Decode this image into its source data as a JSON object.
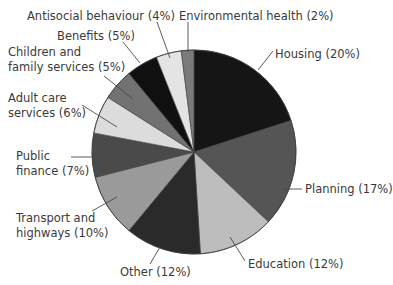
{
  "chart_data": {
    "type": "pie",
    "title": "",
    "start_angle_deg": 0,
    "direction": "clockwise",
    "center": [
      194,
      152
    ],
    "radius": 102,
    "slices": [
      {
        "label": "Housing",
        "value": 20,
        "text": "Housing (20%)",
        "color": "#151515"
      },
      {
        "label": "Planning",
        "value": 17,
        "text": "Planning (17%)",
        "color": "#555555"
      },
      {
        "label": "Education",
        "value": 12,
        "text": "Education (12%)",
        "color": "#bdbdbd"
      },
      {
        "label": "Other",
        "value": 12,
        "text": "Other (12%)",
        "color": "#2a2a2a"
      },
      {
        "label": "Transport and highways",
        "value": 10,
        "text": "Transport and\nhighways (10%)",
        "color": "#9a9a9a"
      },
      {
        "label": "Public finance",
        "value": 7,
        "text": "Public\nfinance (7%)",
        "color": "#4a4a4a"
      },
      {
        "label": "Adult care services",
        "value": 6,
        "text": "Adult care\nservices (6%)",
        "color": "#dcdcdc"
      },
      {
        "label": "Children and family services",
        "value": 5,
        "text": "Children and\nfamily services (5%)",
        "color": "#727272"
      },
      {
        "label": "Benefits",
        "value": 5,
        "text": "Benefits (5%)",
        "color": "#101010"
      },
      {
        "label": "Antisocial behaviour",
        "value": 4,
        "text": "Antisocial behaviour (4%)",
        "color": "#e4e4e4"
      },
      {
        "label": "Environmental health",
        "value": 2,
        "text": "Environmental health (2%)",
        "color": "#7a7a7a"
      }
    ],
    "legend": "none (direct labels with leader lines)"
  },
  "labels": [
    {
      "text": "Housing (20%)",
      "x": 275,
      "y": 47,
      "line": [
        [
          273,
          51
        ],
        [
          258,
          70
        ]
      ]
    },
    {
      "text": "Planning (17%)",
      "x": 305,
      "y": 182,
      "line": [
        [
          282,
          189
        ],
        [
          302,
          189
        ]
      ]
    },
    {
      "text": "Education (12%)",
      "x": 248,
      "y": 257,
      "line": [
        [
          230,
          237
        ],
        [
          245,
          261
        ]
      ]
    },
    {
      "text": "Other (12%)",
      "x": 120,
      "y": 265,
      "line": [
        [
          160,
          247
        ],
        [
          150,
          264
        ]
      ]
    },
    {
      "text": "Transport and\nhighways (10%)",
      "x": 16,
      "y": 211,
      "line": [
        [
          117,
          197
        ],
        [
          92,
          211
        ]
      ]
    },
    {
      "text": "Public\nfinance (7%)",
      "x": 16,
      "y": 149,
      "line": [
        [
          71,
          157
        ],
        [
          111,
          157
        ]
      ]
    },
    {
      "text": "Adult care\nservices (6%)",
      "x": 8,
      "y": 91,
      "line": [
        [
          82,
          105
        ],
        [
          117,
          127
        ]
      ]
    },
    {
      "text": "Children and\nfamily services (5%)",
      "x": 8,
      "y": 45,
      "line": [
        [
          104,
          76
        ],
        [
          133,
          99
        ]
      ]
    },
    {
      "text": "Benefits (5%)",
      "x": 57,
      "y": 29,
      "line": [
        [
          123,
          42
        ],
        [
          140,
          63
        ]
      ]
    },
    {
      "text": "Antisocial behaviour (4%)",
      "x": 27,
      "y": 9,
      "line": [
        [
          157,
          22
        ],
        [
          170,
          58
        ]
      ]
    },
    {
      "text": "Environmental health (2%)",
      "x": 179,
      "y": 9,
      "line": [
        [
          188,
          22
        ],
        [
          188,
          52
        ]
      ]
    }
  ]
}
